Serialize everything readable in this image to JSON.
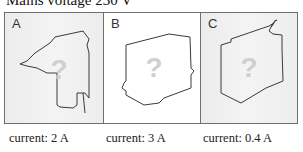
{
  "title": "Mains voltage 230 V",
  "panels": [
    {
      "label": "A",
      "device": "drill-silhouette",
      "placeholder": "?",
      "background": "#efefef",
      "caption": "current: 2 A"
    },
    {
      "label": "B",
      "device": "box-silhouette",
      "placeholder": "?",
      "background": "#ffffff",
      "caption": "current: 3 A"
    },
    {
      "label": "C",
      "device": "box-with-cord-silhouette",
      "placeholder": "?",
      "background": "#efefef",
      "caption": "current: 0.4 A"
    }
  ],
  "colors": {
    "border": "#6f6f6f",
    "outline": "#3a3a3a",
    "question_mark": "#cfcfcf"
  }
}
